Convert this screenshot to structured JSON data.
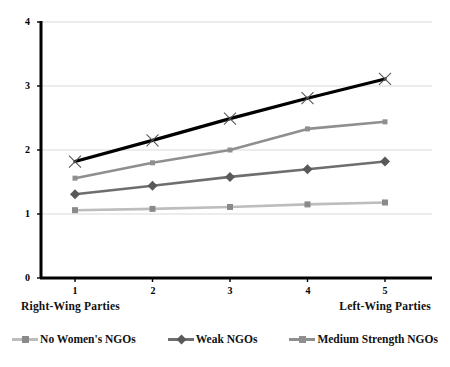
{
  "chart_data": {
    "type": "line",
    "title": "",
    "subtitle": "",
    "xlabel": "",
    "ylabel": "",
    "x": [
      1,
      2,
      3,
      4,
      5
    ],
    "categories": [
      "1",
      "2",
      "3",
      "4",
      "5"
    ],
    "xtick_labels": [
      "1",
      "2",
      "3",
      "4",
      "5"
    ],
    "ytick_labels": [
      "0",
      "1",
      "2",
      "3",
      "4"
    ],
    "yticks": [
      0,
      1,
      2,
      3,
      4
    ],
    "xlim": [
      0.5,
      5.5
    ],
    "ylim": [
      0,
      4
    ],
    "grid": "horizontal",
    "legend_position": "bottom",
    "series": [
      {
        "name": "No Women's NGOs",
        "values": [
          1.06,
          1.08,
          1.11,
          1.15,
          1.18
        ],
        "color": "#bdbdbd",
        "marker": "square"
      },
      {
        "name": "Weak NGOs",
        "values": [
          1.31,
          1.44,
          1.58,
          1.7,
          1.82
        ],
        "color": "#6e6e6e",
        "marker": "diamond"
      },
      {
        "name": "Medium Strength NGOs",
        "values": [
          1.56,
          1.8,
          2.0,
          2.33,
          2.44
        ],
        "color": "#8f8f8f",
        "marker": "line"
      },
      {
        "name": "Strong NGOs",
        "values": [
          1.82,
          2.15,
          2.49,
          2.81,
          3.11
        ],
        "color": "#000000",
        "marker": "cross"
      }
    ],
    "annotations": {
      "left_caption": "Right-Wing Parties",
      "right_caption": "Left-Wing Parties"
    }
  },
  "axis_captions": {
    "left": "Right-Wing Parties",
    "right": "Left-Wing Parties"
  },
  "legend": {
    "entries": [
      {
        "label": "No Women's NGOs",
        "color": "#bdbdbd",
        "marker": "square"
      },
      {
        "label": "Weak NGOs",
        "color": "#6e6e6e",
        "marker": "diamond"
      },
      {
        "label": "Medium Strength NGOs",
        "color": "#8f8f8f",
        "marker": "line"
      }
    ]
  },
  "colors": {
    "axis": "#000000",
    "grid": "#d9d9d9",
    "background": "#ffffff"
  }
}
